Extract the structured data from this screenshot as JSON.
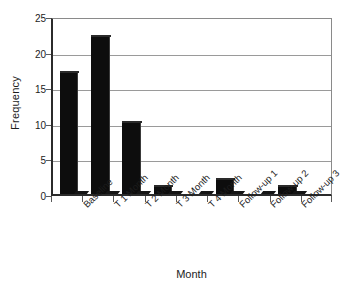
{
  "chart_data": {
    "type": "bar",
    "title": "",
    "subtitle": "",
    "xlabel": "Month",
    "ylabel": "Frequency",
    "categories": [
      "Baseline",
      "T 1 Month",
      "T 2 Month",
      "T 3 Month",
      "T 4 Month",
      "Follow-up 1",
      "Follow-up 2",
      "Follow-up 3"
    ],
    "values": [
      17,
      22,
      10,
      1,
      0,
      2,
      0,
      1
    ],
    "series": [
      {
        "name": "Frequency",
        "values": [
          17,
          22,
          10,
          1,
          0,
          2,
          0,
          1
        ]
      }
    ],
    "ylim": [
      0,
      25
    ],
    "yticks": [
      0,
      5,
      10,
      15,
      20,
      25
    ],
    "ytick_labels": [
      "0",
      "5",
      "10",
      "15",
      "20",
      "25"
    ],
    "grid": true,
    "grid_axis": "y",
    "legend": false,
    "legend_position": "none",
    "bar_color": "#0d0d0d",
    "plot_background": "#ffffff",
    "axis_color": "#2b2b2b",
    "grid_color": "#9a9a9a",
    "label_rotation": -45,
    "annotations": []
  }
}
